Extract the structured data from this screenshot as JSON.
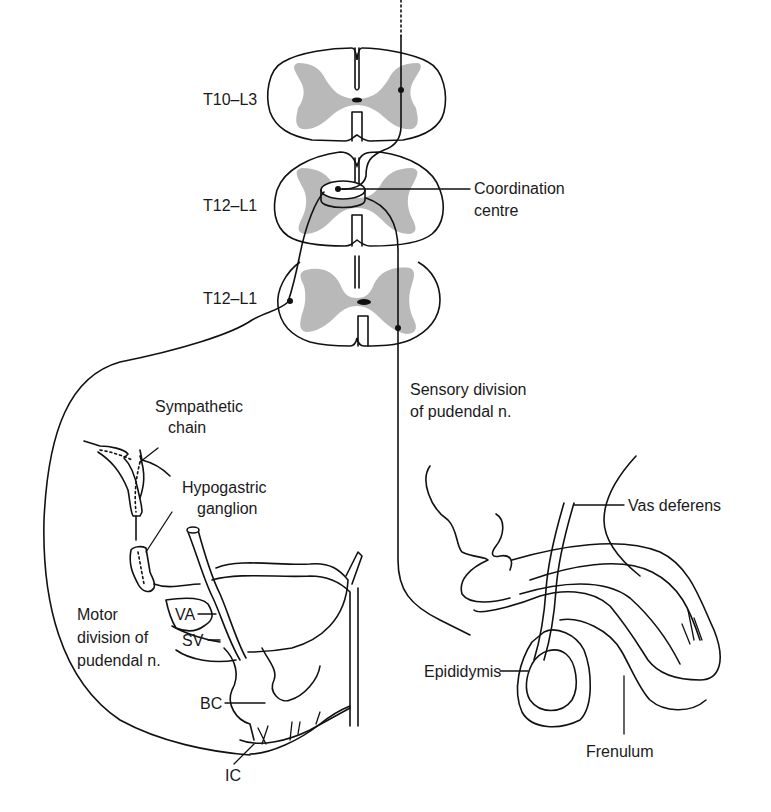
{
  "figure": {
    "type": "anatomical-diagram",
    "colors": {
      "line": "#111111",
      "grey_matter": "#b9b9b9",
      "background": "#ffffff"
    }
  },
  "spinal_segments": [
    {
      "id": "seg1",
      "label": "T10–L3"
    },
    {
      "id": "seg2",
      "label": "T12–L1"
    },
    {
      "id": "seg3",
      "label": "T12–L1"
    }
  ],
  "labels": {
    "coordination_centre": [
      "Coordination",
      "centre"
    ],
    "sensory_division": [
      "Sensory division",
      "of pudendal n."
    ],
    "sympathetic_chain": [
      "Sympathetic",
      "chain"
    ],
    "hypogastric_ganglion": [
      "Hypogastric",
      "ganglion"
    ],
    "motor_division": [
      "Motor",
      "division of",
      "pudendal n."
    ],
    "va": "VA",
    "sv": "SV",
    "bc": "BC",
    "ic": "IC",
    "vas_deferens": "Vas deferens",
    "epididymis": "Epididymis",
    "frenulum": "Frenulum"
  }
}
